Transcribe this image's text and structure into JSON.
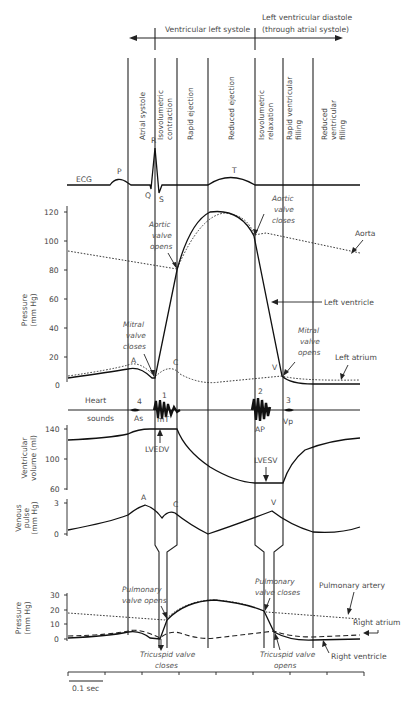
{
  "header": {
    "systole_label": "Ventricular left systole",
    "diastole_label_line1": "Left ventricular diastole",
    "diastole_label_line2": "(through atrial systole)"
  },
  "phases": [
    {
      "label": "Atrial systole",
      "lines": [
        "Atrial systole"
      ]
    },
    {
      "label": "Isovolumetric contraction",
      "lines": [
        "Isovolumetric",
        "contraction"
      ]
    },
    {
      "label": "Rapid ejection",
      "lines": [
        "Rapid ejection"
      ]
    },
    {
      "label": "Reduced ejection",
      "lines": [
        "Reduced ejection"
      ]
    },
    {
      "label": "Isovolumetric relaxation",
      "lines": [
        "Isovolumetric",
        "relaxation"
      ]
    },
    {
      "label": "Rapid ventricular filling",
      "lines": [
        "Rapid ventricular",
        "filling"
      ]
    },
    {
      "label": "Reduced ventricular filling",
      "lines": [
        "Reduced",
        "ventricular",
        "filling"
      ]
    }
  ],
  "ecg": {
    "label": "ECG",
    "waves": {
      "P": "P",
      "Q": "Q",
      "R": "R",
      "S": "S",
      "T": "T"
    }
  },
  "lv_pressure": {
    "axis_label_line1": "Pressure",
    "axis_label_line2": "(mm Hg)",
    "ticks": [
      "120",
      "100",
      "80",
      "60",
      "40",
      "20",
      "0"
    ],
    "annotations": {
      "aortic_opens": [
        "Aortic",
        "valve",
        "opens"
      ],
      "aortic_closes": [
        "Aortic",
        "valve",
        "closes"
      ],
      "mitral_closes": [
        "Mitral",
        "valve",
        "closes"
      ],
      "mitral_opens": [
        "Mitral",
        "valve",
        "opens"
      ],
      "aorta": "Aorta",
      "left_ventricle": "Left ventricle",
      "left_atrium": "Left atrium",
      "wave_a": "A",
      "wave_c": "C",
      "wave_v": "V"
    }
  },
  "heart_sounds": {
    "label_line1": "Heart",
    "label_line2": "sounds",
    "s4": "4",
    "as": "As",
    "s1": "1",
    "mt": "mT",
    "s2": "2",
    "ap": "AP",
    "s3": "3",
    "vp": "Vp"
  },
  "ventricular_volume": {
    "axis_label_line1": "Ventricular",
    "axis_label_line2": "volume (ml)",
    "ticks": [
      "140",
      "100",
      "60"
    ],
    "lvedv": "LVEDV",
    "lvesv": "LVESV"
  },
  "venous_pulse": {
    "axis_label_line1": "Venous",
    "axis_label_line2": "pulse",
    "axis_label_line3": "(mm Hg)",
    "ticks": [
      "3",
      "0"
    ],
    "wave_a": "A",
    "wave_c": "C",
    "wave_v": "V"
  },
  "rv_pressure": {
    "axis_label_line1": "Pressure",
    "axis_label_line2": "(mm Hg)",
    "ticks": [
      "30",
      "20",
      "10",
      "0"
    ],
    "annotations": {
      "pulm_opens": [
        "Pulmonary",
        "valve opens"
      ],
      "pulm_closes": [
        "Pulmonary",
        "valve closes"
      ],
      "tric_closes": [
        "Tricuspid valve",
        "closes"
      ],
      "tric_opens": [
        "Tricuspid valve",
        "opens"
      ],
      "pulmonary_artery": "Pulmonary artery",
      "right_atrium": "Right atrium",
      "right_ventricle": "Right ventricle"
    }
  },
  "time_axis": {
    "scale_label": "0.1 sec"
  }
}
